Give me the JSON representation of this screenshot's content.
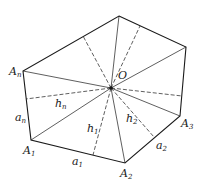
{
  "diagram": {
    "type": "polygon-inradius-decomposition",
    "colors": {
      "stroke": "#1a1a1a",
      "background": "#ffffff"
    },
    "center": {
      "name": "O",
      "x": 111,
      "y": 88
    },
    "vertices": [
      {
        "id": "T",
        "x": 119,
        "y": 16
      },
      {
        "id": "R",
        "x": 186,
        "y": 47
      },
      {
        "id": "A3",
        "x": 180,
        "y": 116
      },
      {
        "id": "A2",
        "x": 125,
        "y": 163
      },
      {
        "id": "A1",
        "x": 31,
        "y": 140
      },
      {
        "id": "An",
        "x": 23,
        "y": 71
      }
    ],
    "perpendicular_feet": [
      {
        "edge": "An-T",
        "x": 83,
        "y": 36
      },
      {
        "edge": "T-R",
        "x": 140,
        "y": 26
      },
      {
        "edge": "R-A3",
        "x": 182,
        "y": 96
      },
      {
        "edge": "A3-A2",
        "x": 154,
        "y": 137
      },
      {
        "edge": "A2-A1",
        "x": 93,
        "y": 155
      },
      {
        "edge": "A1-An",
        "x": 26,
        "y": 99
      }
    ],
    "labels": {
      "An": {
        "base": "A",
        "sub": "n"
      },
      "A1": {
        "base": "A",
        "sub": "1"
      },
      "A2": {
        "base": "A",
        "sub": "2"
      },
      "A3": {
        "base": "A",
        "sub": "3"
      },
      "O": {
        "base": "O",
        "sub": ""
      },
      "an": {
        "base": "a",
        "sub": "n"
      },
      "a1": {
        "base": "a",
        "sub": "1"
      },
      "a2": {
        "base": "a",
        "sub": "2"
      },
      "hn": {
        "base": "h",
        "sub": "n"
      },
      "h1": {
        "base": "h",
        "sub": "1"
      },
      "h2": {
        "base": "h",
        "sub": "2"
      }
    }
  }
}
